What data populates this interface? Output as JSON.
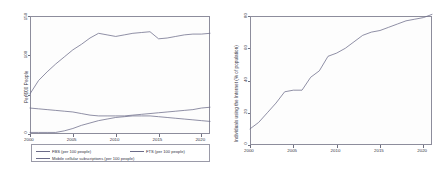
{
  "figure": {
    "background": "#ffffff",
    "line_color": "#6b6b88",
    "frame_color": "#8d8d9c"
  },
  "chart_data": [
    {
      "type": "line",
      "panel": "left",
      "title": "",
      "xlabel": "",
      "ylabel": "Per 100 People",
      "xlim": [
        2000,
        2021
      ],
      "ylim": [
        0,
        150
      ],
      "xticks": [
        "2000",
        "2005",
        "2010",
        "2015",
        "2020"
      ],
      "yticks": [
        "0",
        "50",
        "100",
        "150"
      ],
      "grid": false,
      "legend_position": "bottom",
      "x": [
        2000,
        2001,
        2002,
        2003,
        2004,
        2005,
        2006,
        2007,
        2008,
        2009,
        2010,
        2011,
        2012,
        2013,
        2014,
        2015,
        2016,
        2017,
        2018,
        2019,
        2020,
        2021
      ],
      "series": [
        {
          "name": "Mobile cellular subscriptions (per 100 people)",
          "color": "#6b6b88",
          "values": [
            51,
            68,
            79,
            89,
            98,
            107,
            114,
            122,
            128,
            126,
            124,
            126,
            128,
            129,
            130,
            121,
            122,
            124,
            126,
            127,
            127,
            128
          ]
        },
        {
          "name": "FBS (per 100 people)",
          "color": "#6b6b88",
          "values": [
            33,
            32,
            31,
            30,
            29,
            28,
            26,
            24,
            23,
            23,
            23,
            23,
            24,
            25,
            26,
            27,
            28,
            29,
            30,
            31,
            33,
            34
          ]
        },
        {
          "name": "FTS (per 100 people)",
          "color": "#6b6b88",
          "values": [
            2,
            2,
            2,
            2,
            4,
            7,
            11,
            14,
            17,
            19,
            21,
            22,
            23,
            23,
            23,
            22,
            21,
            20,
            19,
            18,
            17,
            16
          ]
        }
      ],
      "legend": [
        {
          "label": "FBS (per 100 people)",
          "color": "#6b6b88"
        },
        {
          "label": "FTS (per 100 people)",
          "color": "#6b6b88"
        },
        {
          "label": "Mobile cellular subscriptions (per 100 people)",
          "color": "#6b6b88"
        }
      ]
    },
    {
      "type": "line",
      "panel": "right",
      "title": "",
      "xlabel": "",
      "ylabel": "Individuals using the Internet (% of population)",
      "xlim": [
        2000,
        2021
      ],
      "ylim": [
        0,
        80
      ],
      "xticks": [
        "2000",
        "2005",
        "2010",
        "2015",
        "2020"
      ],
      "yticks": [
        "0",
        "20",
        "40",
        "60",
        "80"
      ],
      "grid": false,
      "legend_position": "none",
      "x": [
        2000,
        2001,
        2002,
        2003,
        2004,
        2005,
        2006,
        2007,
        2008,
        2009,
        2010,
        2011,
        2012,
        2013,
        2014,
        2015,
        2016,
        2017,
        2018,
        2019,
        2020,
        2021
      ],
      "series": [
        {
          "name": "Individuals using the Internet (% of population)",
          "color": "#6b6b88",
          "values": [
            10,
            14,
            20,
            26,
            33,
            34,
            34,
            42,
            46,
            55,
            57,
            60,
            64,
            68,
            70,
            71,
            73,
            75,
            77,
            78,
            79,
            81
          ]
        }
      ]
    }
  ]
}
